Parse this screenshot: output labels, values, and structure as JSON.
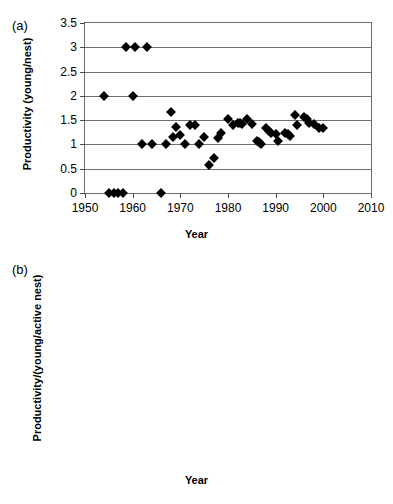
{
  "figure": {
    "panels": [
      {
        "tag": "(a)",
        "chart_data": {
          "type": "scatter",
          "title": "",
          "xlabel": "Year",
          "ylabel": "Productivity (young/nest)",
          "xlim": [
            1950,
            2010
          ],
          "ylim": [
            0,
            3.5
          ],
          "xticks": [
            1950,
            1960,
            1970,
            1980,
            1990,
            2000,
            2010
          ],
          "yticks": [
            0,
            0.5,
            1,
            1.5,
            2,
            2.5,
            3,
            3.5
          ],
          "grid": "horizontal",
          "legend": "none",
          "marker": "filled-diamond",
          "marker_color": "#000000",
          "points": [
            [
              1954,
              2.0
            ],
            [
              1955,
              0.0
            ],
            [
              1956,
              0.0
            ],
            [
              1957,
              0.0
            ],
            [
              1958,
              0.0
            ],
            [
              1958.5,
              3.0
            ],
            [
              1960,
              2.0
            ],
            [
              1960.5,
              3.0
            ],
            [
              1963,
              3.0
            ],
            [
              1962,
              1.0
            ],
            [
              1964,
              1.0
            ],
            [
              1966,
              0.0
            ],
            [
              1967,
              1.0
            ],
            [
              1968,
              1.67
            ],
            [
              1968.5,
              1.15
            ],
            [
              1969,
              1.36
            ],
            [
              1970,
              1.2
            ],
            [
              1971,
              1.0
            ],
            [
              1972,
              1.4
            ],
            [
              1973,
              1.4
            ],
            [
              1974,
              1.0
            ],
            [
              1975,
              1.16
            ],
            [
              1976,
              0.58
            ],
            [
              1977,
              0.73
            ],
            [
              1978,
              1.13
            ],
            [
              1978.5,
              1.24
            ],
            [
              1980,
              1.52
            ],
            [
              1981,
              1.41
            ],
            [
              1982,
              1.44
            ],
            [
              1982.5,
              1.44
            ],
            [
              1983,
              1.43
            ],
            [
              1984,
              1.53
            ],
            [
              1985,
              1.42
            ],
            [
              1986,
              1.07
            ],
            [
              1986.5,
              1.05
            ],
            [
              1987,
              1.01
            ],
            [
              1988,
              1.34
            ],
            [
              1988.5,
              1.27
            ],
            [
              1989,
              1.23
            ],
            [
              1990,
              1.22
            ],
            [
              1990.5,
              1.07
            ],
            [
              1992,
              1.24
            ],
            [
              1992.5,
              1.22
            ],
            [
              1993,
              1.18
            ],
            [
              1994,
              1.6
            ],
            [
              1994.5,
              1.4
            ],
            [
              1996,
              1.56
            ],
            [
              1996.5,
              1.53
            ],
            [
              1997,
              1.45
            ],
            [
              1998,
              1.42
            ],
            [
              1999,
              1.33
            ],
            [
              2000,
              1.33
            ]
          ]
        }
      },
      {
        "tag": "(b)",
        "chart_data": {
          "type": "scatter",
          "title": "",
          "xlabel": "Year",
          "ylabel": "Productivity/(young/active nest)",
          "xlim": [
            1940,
            2020
          ],
          "ylim": [
            0,
            2.5
          ],
          "xticks": [
            1940,
            1960,
            1980,
            2000,
            2020
          ],
          "yticks": [
            0,
            0.5,
            1,
            1.5,
            2,
            2.5
          ],
          "grid": "horizontal",
          "legend": "none",
          "marker": "filled-diamond",
          "marker_color": "#000000",
          "points": [
            [
              1957,
              0.0
            ],
            [
              1954,
              1.0
            ],
            [
              1955,
              1.0
            ],
            [
              1956,
              1.0
            ],
            [
              1957,
              1.0
            ],
            [
              1958,
              1.0
            ],
            [
              1959,
              1.0
            ],
            [
              1960,
              1.0
            ],
            [
              1961,
              1.0
            ],
            [
              1962,
              1.0
            ],
            [
              1963,
              1.0
            ],
            [
              1964,
              1.0
            ],
            [
              1964.5,
              2.0
            ],
            [
              1965,
              1.0
            ],
            [
              1966,
              1.35
            ],
            [
              1966.5,
              1.0
            ],
            [
              1968,
              1.0
            ],
            [
              1968.5,
              0.84
            ],
            [
              1970,
              0.75
            ],
            [
              1971,
              0.65
            ],
            [
              1971.5,
              0.64
            ],
            [
              1972,
              0.76
            ],
            [
              1973,
              0.96
            ],
            [
              1973.5,
              0.75
            ],
            [
              1974,
              0.73
            ],
            [
              1975,
              0.7
            ],
            [
              1976,
              0.63
            ],
            [
              1977,
              0.62
            ],
            [
              1978,
              0.78
            ],
            [
              1979,
              0.8
            ],
            [
              1980,
              0.78
            ],
            [
              1981,
              0.72
            ],
            [
              1982,
              0.7
            ],
            [
              1983,
              0.84
            ],
            [
              1984,
              0.8
            ],
            [
              1985,
              0.72
            ],
            [
              1986,
              0.76
            ],
            [
              1987,
              0.74
            ],
            [
              1988,
              0.68
            ],
            [
              1989,
              0.65
            ],
            [
              1990,
              0.6
            ],
            [
              1990.5,
              0.65
            ],
            [
              1992,
              0.85
            ],
            [
              1993,
              0.88
            ],
            [
              1994,
              0.9
            ],
            [
              1995,
              0.9
            ],
            [
              1996,
              0.89
            ],
            [
              1997,
              0.88
            ],
            [
              1998,
              0.87
            ],
            [
              1999,
              0.86
            ],
            [
              2000,
              0.85
            ]
          ]
        }
      }
    ]
  }
}
